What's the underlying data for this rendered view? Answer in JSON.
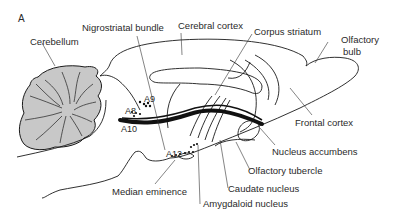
{
  "figure": {
    "panel_label": "A",
    "labels": {
      "cerebellum": "Cerebellum",
      "nigrostriatal_bundle": "Nigrostriatal bundle",
      "cerebral_cortex": "Cerebral cortex",
      "corpus_striatum": "Corpus striatum",
      "olfactory_bulb_line1": "Olfactory",
      "olfactory_bulb_line2": "bulb",
      "frontal_cortex": "Frontal cortex",
      "nucleus_accumbens": "Nucleus accumbens",
      "olfactory_tubercle": "Olfactory tubercle",
      "caudate_nucleus": "Caudate nucleus",
      "amygdaloid_nucleus": "Amygdaloid nucleus",
      "median_eminence": "Median eminence",
      "a8": "A8",
      "a9": "A9",
      "a10": "A10",
      "a12": "A12"
    },
    "colors": {
      "outline": "#1a1a1a",
      "cerebellum_fill": "#c8c8c8",
      "pathway": "#111111",
      "background": "#ffffff"
    }
  }
}
